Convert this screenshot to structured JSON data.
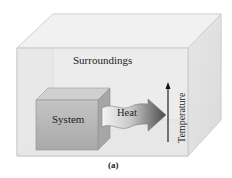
{
  "diagram": {
    "type": "thermodynamics-system-surroundings",
    "labels": {
      "surroundings": "Surroundings",
      "system": "System",
      "heat": "Heat",
      "temperature": "Temperature",
      "caption": "(a)"
    },
    "arrows": [
      {
        "name": "heat-arrow",
        "from": "System",
        "to": "Surroundings",
        "label": "Heat"
      },
      {
        "name": "temperature-arrow",
        "direction": "up",
        "label": "Temperature"
      }
    ],
    "colors": {
      "outer_box_front": "#ececec",
      "outer_box_side": "#e2e2e2",
      "outer_box_top": "#f0f0f0",
      "system_front": "#b8b8b8",
      "system_top": "#cfcfcf",
      "system_side": "#a8a8a8",
      "heat_arrow_light": "#f2f2f2",
      "heat_arrow_dark": "#555555",
      "temperature_arrow": "#111111"
    }
  }
}
